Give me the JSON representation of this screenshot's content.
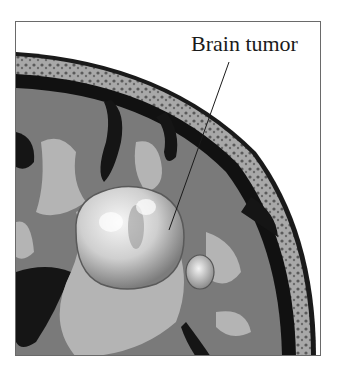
{
  "illustration": {
    "subject": "Cross-section of brain showing tumor",
    "label": "Brain tumor",
    "colors": {
      "background": "#ffffff",
      "skull": "#a8a8a8",
      "dura_dark": "#111111",
      "gray_matter": "#7a7a7a",
      "white_matter": "#b4b4b4",
      "tumor": "#d8d8d8"
    }
  }
}
